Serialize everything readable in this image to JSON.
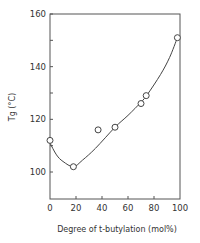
{
  "chart_data": {
    "type": "scatter",
    "title": "",
    "xlabel": "Degree of t-butylation (mol%)",
    "ylabel": "Tg (°C)",
    "xlim": [
      0,
      100
    ],
    "ylim": [
      90,
      160
    ],
    "x_ticks": [
      0,
      20,
      40,
      60,
      80,
      100
    ],
    "y_ticks": [
      100,
      120,
      140,
      160
    ],
    "y_minor_ticks": [
      110,
      130,
      150
    ],
    "grid": false,
    "legend": null,
    "series": [
      {
        "name": "measured",
        "marker": "open-circle",
        "x": [
          0,
          18,
          37,
          50,
          70,
          74,
          98
        ],
        "y": [
          112,
          102,
          116,
          117,
          126,
          129,
          151
        ]
      },
      {
        "name": "fitted curve",
        "style": "line",
        "x": [
          0,
          5,
          10,
          18,
          25,
          35,
          50,
          60,
          70,
          75,
          85,
          92,
          98
        ],
        "y": [
          111,
          106.5,
          104,
          102,
          104.5,
          109,
          117,
          121.5,
          126.5,
          129.5,
          137,
          143.5,
          151
        ]
      }
    ]
  },
  "colors": {
    "ink": "#444444",
    "background": "#ffffff"
  }
}
